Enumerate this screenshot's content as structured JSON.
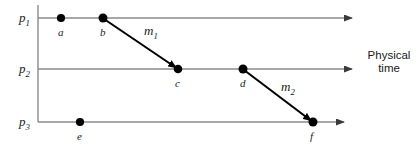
{
  "figure": {
    "background_color": "#ffffff",
    "line_color": "#808080",
    "message_color": "#000000",
    "dot_color": "#000000",
    "width": 419,
    "height": 147
  },
  "axes": {
    "caption": "Physical\ntime",
    "vertical_rule": {
      "x": 38,
      "y1": 5,
      "y2": 122
    },
    "timelines": [
      {
        "id": "p1",
        "label_base": "p",
        "label_sub": "1",
        "y": 18,
        "x_start": 38,
        "x_end": 356
      },
      {
        "id": "p2",
        "label_base": "p",
        "label_sub": "2",
        "y": 69,
        "x_start": 38,
        "x_end": 356
      },
      {
        "id": "p3",
        "label_base": "p",
        "label_sub": "3",
        "y": 122,
        "x_start": 38,
        "x_end": 348
      }
    ]
  },
  "events": [
    {
      "id": "a",
      "label": "a",
      "process": "p1",
      "x": 61,
      "y": 18
    },
    {
      "id": "b",
      "label": "b",
      "process": "p1",
      "x": 103,
      "y": 18
    },
    {
      "id": "c",
      "label": "c",
      "process": "p2",
      "x": 178,
      "y": 69
    },
    {
      "id": "d",
      "label": "d",
      "process": "p2",
      "x": 243,
      "y": 69
    },
    {
      "id": "e",
      "label": "e",
      "process": "p3",
      "x": 80,
      "y": 122
    },
    {
      "id": "f",
      "label": "f",
      "process": "p3",
      "x": 313,
      "y": 122
    }
  ],
  "messages": [
    {
      "id": "m1",
      "label_base": "m",
      "label_sub": "1",
      "from": "b",
      "to": "c",
      "x1": 103,
      "y1": 18,
      "x2": 178,
      "y2": 69,
      "label_x": 146,
      "label_y": 24
    },
    {
      "id": "m2",
      "label_base": "m",
      "label_sub": "2",
      "from": "d",
      "to": "f",
      "x1": 243,
      "y1": 69,
      "x2": 313,
      "y2": 122,
      "label_x": 282,
      "label_y": 80
    }
  ],
  "caption_position": {
    "x": 364,
    "y": 50
  }
}
